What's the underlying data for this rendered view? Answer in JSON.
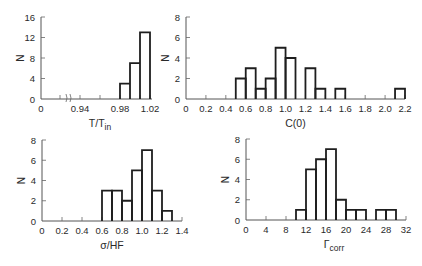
{
  "chart_data": [
    {
      "type": "bar",
      "panel": "top-left",
      "title": "",
      "xlabel": "T/T",
      "xlabel_sub": "in",
      "ylabel": "N",
      "axis_break": true,
      "x_ticks": [
        {
          "label": "0",
          "px": 41
        },
        {
          "label": "0.94",
          "px": 80
        },
        {
          "label": "0.98",
          "px": 120
        },
        {
          "label": "1.02",
          "px": 150
        }
      ],
      "minor_tick_px": [
        60,
        100,
        140
      ],
      "y_ticks": [
        0,
        4,
        8,
        12,
        16
      ],
      "ylim": [
        0,
        16
      ],
      "bins": [
        {
          "x0": 0.98,
          "x1": 0.99,
          "count": 3
        },
        {
          "x0": 0.99,
          "x1": 1.0,
          "count": 7
        },
        {
          "x0": 1.0,
          "x1": 1.01,
          "count": 13
        }
      ],
      "frame": {
        "x0": 41,
        "xEnd": 152,
        "y0": 99,
        "yTop": 17,
        "bin_px": [
          [
            120,
            130
          ],
          [
            130,
            140
          ],
          [
            140,
            150
          ]
        ]
      }
    },
    {
      "type": "bar",
      "panel": "top-right",
      "title": "",
      "xlabel": "C(0)",
      "ylabel": "N",
      "x_ticks": [
        "0",
        "0.2",
        "0.4",
        "0.6",
        "0.8",
        "1.0",
        "1.2",
        "1.4",
        "1.6",
        "1.8",
        "2.0",
        "2.2"
      ],
      "xlim": [
        0,
        2.2
      ],
      "y_ticks": [
        0,
        2,
        4,
        6,
        8
      ],
      "ylim": [
        0,
        8
      ],
      "bins": [
        {
          "x0": 0.5,
          "x1": 0.6,
          "count": 2
        },
        {
          "x0": 0.6,
          "x1": 0.7,
          "count": 3
        },
        {
          "x0": 0.7,
          "x1": 0.8,
          "count": 1
        },
        {
          "x0": 0.8,
          "x1": 0.9,
          "count": 2
        },
        {
          "x0": 0.9,
          "x1": 1.0,
          "count": 5
        },
        {
          "x0": 1.0,
          "x1": 1.1,
          "count": 4
        },
        {
          "x0": 1.1,
          "x1": 1.2,
          "count": 0
        },
        {
          "x0": 1.2,
          "x1": 1.3,
          "count": 3
        },
        {
          "x0": 1.3,
          "x1": 1.4,
          "count": 1
        },
        {
          "x0": 1.4,
          "x1": 1.5,
          "count": 0
        },
        {
          "x0": 1.5,
          "x1": 1.6,
          "count": 1
        },
        {
          "x0": 2.1,
          "x1": 2.2,
          "count": 1
        }
      ],
      "frame": {
        "x0": 186,
        "xEnd": 405,
        "y0": 99,
        "yTop": 17
      }
    },
    {
      "type": "bar",
      "panel": "bottom-left",
      "title": "",
      "xlabel": "σ/HF",
      "ylabel": "N",
      "x_ticks": [
        "0",
        "0.2",
        "0.4",
        "0.6",
        "0.8",
        "1.0",
        "1.2",
        "1.4"
      ],
      "xlim": [
        0,
        1.4
      ],
      "y_ticks": [
        0,
        2,
        4,
        6,
        8
      ],
      "ylim": [
        0,
        8
      ],
      "bins": [
        {
          "x0": 0.6,
          "x1": 0.7,
          "count": 3
        },
        {
          "x0": 0.7,
          "x1": 0.8,
          "count": 3
        },
        {
          "x0": 0.8,
          "x1": 0.9,
          "count": 2
        },
        {
          "x0": 0.9,
          "x1": 1.0,
          "count": 5
        },
        {
          "x0": 1.0,
          "x1": 1.1,
          "count": 7
        },
        {
          "x0": 1.1,
          "x1": 1.2,
          "count": 3
        },
        {
          "x0": 1.2,
          "x1": 1.3,
          "count": 1
        }
      ],
      "frame": {
        "x0": 42,
        "xEnd": 182,
        "y0": 221,
        "yTop": 140
      }
    },
    {
      "type": "bar",
      "panel": "bottom-right",
      "title": "",
      "xlabel": "Γ",
      "xlabel_sub": "corr",
      "ylabel": "N",
      "x_ticks": [
        "0",
        "4",
        "8",
        "12",
        "16",
        "20",
        "24",
        "28",
        "32"
      ],
      "xlim": [
        0,
        32
      ],
      "y_ticks": [
        0,
        2,
        4,
        6,
        8
      ],
      "ylim": [
        0,
        8
      ],
      "arrow_marker_at": 14,
      "bins": [
        {
          "x0": 10,
          "x1": 12,
          "count": 1
        },
        {
          "x0": 12,
          "x1": 14,
          "count": 5
        },
        {
          "x0": 14,
          "x1": 16,
          "count": 6
        },
        {
          "x0": 16,
          "x1": 18,
          "count": 7
        },
        {
          "x0": 18,
          "x1": 20,
          "count": 2
        },
        {
          "x0": 20,
          "x1": 22,
          "count": 1
        },
        {
          "x0": 22,
          "x1": 24,
          "count": 1
        },
        {
          "x0": 24,
          "x1": 26,
          "count": 0
        },
        {
          "x0": 26,
          "x1": 28,
          "count": 1
        },
        {
          "x0": 28,
          "x1": 30,
          "count": 1
        }
      ],
      "frame": {
        "x0": 246,
        "xEnd": 406,
        "y0": 220,
        "yTop": 139
      }
    }
  ]
}
